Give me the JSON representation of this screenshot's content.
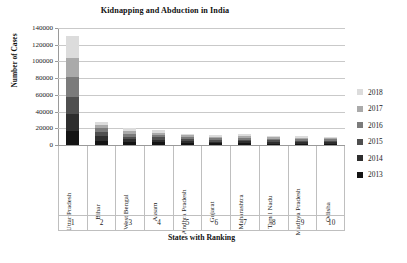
{
  "chart_data": {
    "type": "bar",
    "subtype": "stacked-column",
    "title": "Kidnapping and Abduction in India",
    "xlabel": "States with Ranking",
    "ylabel": "Number of Cases",
    "ylim": [
      0,
      140000
    ],
    "ytick_step": 20000,
    "ytick_labels": [
      "140000",
      "120000",
      "100000",
      "80000",
      "60000",
      "40000",
      "20000",
      "0"
    ],
    "ytick_values": [
      140000,
      120000,
      100000,
      80000,
      60000,
      40000,
      20000,
      0
    ],
    "grid": true,
    "legend_position": "right",
    "categories": [
      "Uttar Pradesh",
      "Bihar",
      "West Bengal",
      "Assam",
      "Andhra Pradesh",
      "Gujarat",
      "Maharashtra",
      "Tamil Nadu",
      "Madhya Pradesh",
      "Odisha"
    ],
    "ranks": [
      "1",
      "2",
      "3",
      "4",
      "5",
      "6",
      "7",
      "8",
      "9",
      "10"
    ],
    "series": [
      {
        "name": "2013",
        "color": "#141414",
        "values": [
          17200,
          4900,
          3300,
          3100,
          2400,
          2000,
          2100,
          1800,
          1700,
          1700
        ]
      },
      {
        "name": "2014",
        "color": "#2e2e2e",
        "values": [
          19700,
          5600,
          3500,
          3200,
          2500,
          2100,
          2200,
          1900,
          1800,
          1800
        ]
      },
      {
        "name": "2015",
        "color": "#4f4f4f",
        "values": [
          21100,
          5000,
          3400,
          3000,
          2300,
          2100,
          2300,
          1900,
          1800,
          1700
        ]
      },
      {
        "name": "2016",
        "color": "#7b7b7b",
        "values": [
          23200,
          4600,
          3300,
          2900,
          2200,
          2000,
          2200,
          1900,
          1700,
          1600
        ]
      },
      {
        "name": "2017",
        "color": "#aaaaaa",
        "values": [
          23400,
          4200,
          3200,
          2800,
          2100,
          2000,
          2100,
          1800,
          1700,
          1600
        ]
      },
      {
        "name": "2018",
        "color": "#dcdcdc",
        "values": [
          26400,
          3700,
          3300,
          2800,
          2200,
          1900,
          2100,
          1800,
          1700,
          1600
        ]
      }
    ],
    "totals": [
      131000,
      28000,
      20000,
      17800,
      13700,
      12100,
      13000,
      11100,
      10400,
      10000
    ],
    "legend_order": [
      "2018",
      "2017",
      "2016",
      "2015",
      "2014",
      "2013"
    ]
  },
  "legend": {
    "items": [
      {
        "label": "2018",
        "color": "#dcdcdc"
      },
      {
        "label": "2017",
        "color": "#aaaaaa"
      },
      {
        "label": "2016",
        "color": "#7b7b7b"
      },
      {
        "label": "2015",
        "color": "#4f4f4f"
      },
      {
        "label": "2014",
        "color": "#2e2e2e"
      },
      {
        "label": "2013",
        "color": "#141414"
      }
    ]
  }
}
